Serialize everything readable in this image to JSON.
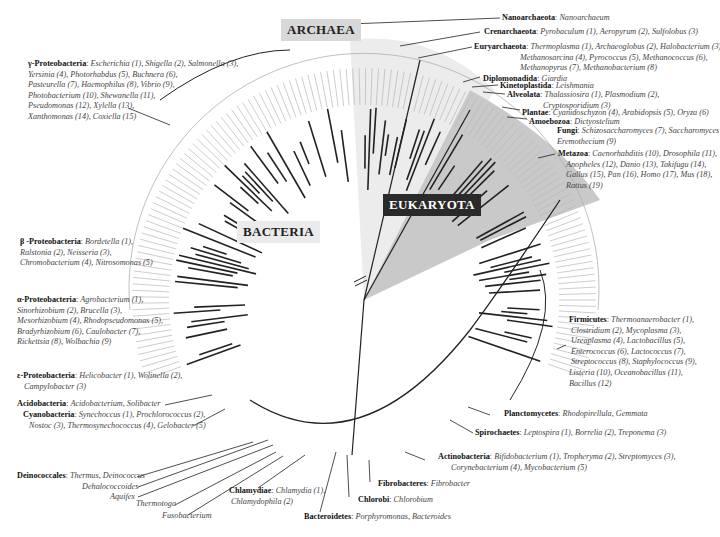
{
  "domains": {
    "archaea": "ARCHAEA",
    "bacteria": "BACTERIA",
    "eukaryota": "EUKARYOTA"
  },
  "groups": [
    {
      "id": "nanoarchaeota",
      "name": "Nanoarchaeota",
      "members": "Nanoarchaeum"
    },
    {
      "id": "crenarchaeota",
      "name": "Crenarchaeota",
      "members": "Pyrobaculum (1), Aeropyrum (2), Sulfolobus (3)"
    },
    {
      "id": "euryarchaeota",
      "name": "Euryarchaeota",
      "members": "Thermoplasma (1), Archaeoglobus (2), Halobacterium (3),",
      "members2": "Methanosarcina (4), Pyrococcus (5), Methanococcus (6),",
      "members3": "Methanopyrus (7), Methanobacterium (8)"
    },
    {
      "id": "diplomonadida",
      "name": "Diplomonadida",
      "members": "Giardia"
    },
    {
      "id": "kinetoplastida",
      "name": "Kinetoplastida",
      "members": "Leishmania"
    },
    {
      "id": "alveolata",
      "name": "Alveolata",
      "members": "Thalassiosira (1), Plasmodium (2),",
      "members2": "Cryptosporidium (3)"
    },
    {
      "id": "plantae",
      "name": "Plantae",
      "members": "Cyanidoschyzon (4), Arabidopsis (5), Oryza (6)"
    },
    {
      "id": "amoebozoa",
      "name": "Amoebozoa",
      "members": "Dictyostelium"
    },
    {
      "id": "fungi",
      "name": "Fungi",
      "members": "Schizosaccharomyces (7), Saccharomyces (8),",
      "members2": "Eremothecium (9)"
    },
    {
      "id": "metazoa",
      "name": "Metazoa",
      "members": "Caenorhabditis (10), Drosophila (11),",
      "members2": "Anopheles (12), Danio (13), Takifugu (14),",
      "members3": "Gallus (15), Pan (16), Homo (17), Mus (18),",
      "members4": "Rattus (19)"
    },
    {
      "id": "firmicutes",
      "name": "Firmicutes",
      "members": "Thermoanaerobacter (1),",
      "members2": "Clostridium (2), Mycoplasma (3),",
      "members3": "Ureaplasma (4), Lactobacillus (5),",
      "members4": "Enterococcus (6), Lactococcus (7),",
      "members5": "Streptococcus (8),  Staphylococcus (9),",
      "members6": "Listeria (10), Oceanobacillus (11),",
      "members7": "Bacillus (12)"
    },
    {
      "id": "planctomycetes",
      "name": "Planctomycetes",
      "members": "Rhodopirellula, Gemmata"
    },
    {
      "id": "spirochaetes",
      "name": "Spirochaetes",
      "members": "Leptospira (1), Borrelia (2), Treponema (3)"
    },
    {
      "id": "actinobacteria",
      "name": "Actinobacteria",
      "members": "Bifidobacterium (1), Tropheryma (2), Streptomyces (3),",
      "members2": "Corynebacterium (4), Mycobacterium (5)"
    },
    {
      "id": "fibrobacteres",
      "name": "Fibrobacteres",
      "members": "Fibrobacter"
    },
    {
      "id": "chlorobi",
      "name": "Chlorobi",
      "members": "Chlorobium"
    },
    {
      "id": "bacteroidetes",
      "name": "Bacteroidetes",
      "members": "Porphyromonas, Bacteroides"
    },
    {
      "id": "chlamydiae",
      "name": "Chlamydiae",
      "members": "Chlamydia (1),",
      "members2": "Chlamydophila (2)"
    },
    {
      "id": "deinococcales",
      "name": "Deinococcales",
      "members": "Thermus, Deinococcus"
    },
    {
      "id": "dehalococcoides",
      "name": "",
      "members": "Dehalococcoides"
    },
    {
      "id": "aquifex",
      "name": "",
      "members": "Aquifex"
    },
    {
      "id": "thermotoga",
      "name": "",
      "members": "Thermotoga"
    },
    {
      "id": "fusobacterium",
      "name": "",
      "members": "Fusobacterium"
    },
    {
      "id": "cyanobacteria",
      "name": "Cyanobacteria",
      "members": "Synechoccus (1), Prochlorococcus (2),",
      "members2": "Nostoc (3), Thermosynechococcus (4), Gelobacter (5)"
    },
    {
      "id": "acidobacteria",
      "name": "Acidobacteria",
      "members": "Acidobacterium, Solibacter"
    },
    {
      "id": "epsilon",
      "name": "ε-Proteobacteria",
      "members": "Helicobacter (1), Wolinella (2),",
      "members2": "Campylobacter (3)"
    },
    {
      "id": "alpha",
      "name": "α-Proteobacteria",
      "members": "Agrobacterium (1),",
      "members2": "Sinorhizobium (2), Brucella (3),",
      "members3": "Mesorhizobium (4), Rhodopseudomonas (5),",
      "members4": "Bradyrhizobium (6), Caulobacter (7),",
      "members5": "Rickettsia (8), Wolbachia (9)"
    },
    {
      "id": "beta",
      "name": "β -Proteobacteria",
      "members": "Bordetella (1),",
      "members2": "Ralstonia (2), Neisseria (3),",
      "members3": "Chromobacterium (4), Nitrosomonas (5)"
    },
    {
      "id": "gamma",
      "name": "γ-Proteobacteria",
      "members": "Escherichia (1), Shigella (2), Salmonella (3),",
      "members2": "Yersinia (4), Photorhabdus (5), Buchnera (6),",
      "members3": "Pasteurella (7), Haemophilus (8), Vibrio (9),",
      "members4": "Photobacterium (10), Shewanella (11),",
      "members5": "Pseudomonas (12), Xylella (13),",
      "members6": "Xanthomonas (14), Coxiella (15)"
    }
  ],
  "colors": {
    "archaea_shade": "#e4e4e4",
    "eukaryota_shade": "#c4c4c4",
    "line": "#222222",
    "leaf": "#aaaaaa"
  }
}
